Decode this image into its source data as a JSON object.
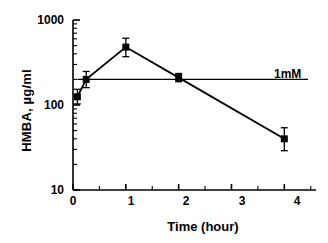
{
  "chart_data": {
    "type": "line",
    "title": "",
    "xlabel": "Time (hour)",
    "ylabel": "HMBA, µg/ml",
    "xlim": [
      0,
      4.6
    ],
    "ylim": [
      10,
      1000
    ],
    "yscale": "log",
    "grid": false,
    "legend_position": "none",
    "xticks": [
      0,
      1,
      2,
      3,
      4
    ],
    "xticklabels": [
      "0",
      "1",
      "2",
      "3",
      "4"
    ],
    "yticks": [
      10,
      100,
      1000
    ],
    "yticklabels": [
      "10",
      "100",
      "1000"
    ],
    "series": [
      {
        "name": "HMBA plasma concentration",
        "marker": "filled-square",
        "color": "#000000",
        "x": [
          0.083,
          0.25,
          1,
          2,
          4
        ],
        "values": [
          125,
          200,
          480,
          210,
          40
        ],
        "yerr_low": [
          22,
          40,
          110,
          22,
          11
        ],
        "yerr_high": [
          28,
          48,
          130,
          25,
          14
        ]
      }
    ],
    "reference_lines": [
      {
        "name": "1mM",
        "orientation": "horizontal",
        "y": 200,
        "label": "1mM",
        "color": "#000000",
        "x_start": 0.083,
        "x_end": 4.45
      }
    ],
    "annotations": [
      {
        "text": "1mM",
        "x": 4.5,
        "y": 200
      }
    ]
  },
  "axes": {
    "y_top_label": "1000",
    "y_mid_label": "100",
    "y_bottom_label": "10",
    "x_labels": [
      "0",
      "1",
      "2",
      "3",
      "4"
    ],
    "x_title": "Time (hour)",
    "y_title": "HMBA, µg/ml"
  },
  "annotation": {
    "ref_line_label": "1mM"
  },
  "colors": {
    "ink": "#000000",
    "background": "#ffffff"
  }
}
